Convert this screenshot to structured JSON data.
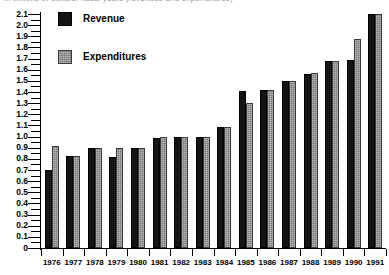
{
  "clipped_title": "in billions of dollars, fiscal years (revenues and expenditures)",
  "legend": {
    "position": "top-left-inside",
    "entries": [
      {
        "label": "Revenue",
        "swatch": "black-square-icon",
        "color": "#141414"
      },
      {
        "label": "Expenditures",
        "swatch": "gray-square-icon",
        "color": "#7a7a7a"
      }
    ]
  },
  "chart_data": {
    "type": "bar",
    "title": "",
    "subtitle": "",
    "xlabel": "",
    "ylabel": "",
    "grid": false,
    "legend_position": "upper left",
    "ylim": [
      0,
      2.1
    ],
    "ytick_step": 0.1,
    "ytick_labels": [
      "0",
      "0.1",
      "0.2",
      "0.3",
      "0.4",
      "0.5",
      "0.6",
      "0.7",
      "0.8",
      "0.9",
      "1.0",
      "1.1",
      "1.2",
      "1.3",
      "1.4",
      "1.5",
      "1.6",
      "1.7",
      "1.8",
      "1.9",
      "2.0",
      "2.1"
    ],
    "ytick_values": [
      0,
      0.1,
      0.2,
      0.3,
      0.4,
      0.5,
      0.6,
      0.7,
      0.8,
      0.9,
      1.0,
      1.1,
      1.2,
      1.3,
      1.4,
      1.5,
      1.6,
      1.7,
      1.8,
      1.9,
      2.0,
      2.1
    ],
    "categories": [
      "1976",
      "1977",
      "1978",
      "1979",
      "1980",
      "1981",
      "1982",
      "1983",
      "1984",
      "1985",
      "1986",
      "1987",
      "1988",
      "1989",
      "1990",
      "1991"
    ],
    "series": [
      {
        "name": "Revenue",
        "color": "#141414",
        "values": [
          0.7,
          0.83,
          0.9,
          0.82,
          0.9,
          0.99,
          1.0,
          1.0,
          1.09,
          1.41,
          1.42,
          1.5,
          1.56,
          1.68,
          1.69,
          2.1
        ]
      },
      {
        "name": "Expenditures",
        "color": "#7a7a7a",
        "values": [
          0.92,
          0.83,
          0.9,
          0.9,
          0.9,
          1.0,
          1.0,
          1.0,
          1.09,
          1.3,
          1.42,
          1.5,
          1.57,
          1.68,
          1.88,
          2.1
        ]
      }
    ]
  }
}
